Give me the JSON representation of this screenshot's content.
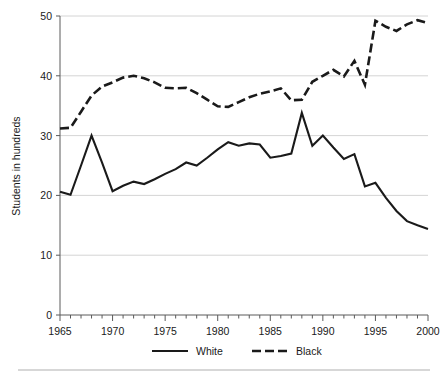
{
  "chart_data": {
    "type": "line",
    "title": "",
    "xlabel": "",
    "ylabel": "Students in hundreds",
    "xlim": [
      1965,
      2000
    ],
    "ylim": [
      0,
      50
    ],
    "yticks": [
      0,
      10,
      20,
      30,
      40,
      50
    ],
    "ytick_labels": [
      "0",
      "10",
      "20",
      "30",
      "40",
      "50"
    ],
    "xticks": [
      1965,
      1970,
      1975,
      1980,
      1985,
      1990,
      1995,
      2000
    ],
    "xtick_labels": [
      "1965",
      "1970",
      "1975",
      "1980",
      "1985",
      "1990",
      "1995",
      "2000"
    ],
    "minor_xticks_every": 1,
    "grid": "horizontal",
    "legend_position": "bottom",
    "x": [
      1965,
      1966,
      1967,
      1968,
      1969,
      1970,
      1971,
      1972,
      1973,
      1974,
      1975,
      1976,
      1977,
      1978,
      1979,
      1980,
      1981,
      1982,
      1983,
      1984,
      1985,
      1986,
      1987,
      1988,
      1989,
      1990,
      1991,
      1992,
      1993,
      1994,
      1995,
      1996,
      1997,
      1998,
      1999,
      2000
    ],
    "series": [
      {
        "name": "White",
        "style": "solid",
        "color": "#1a1a1a",
        "values": [
          20.6,
          20.1,
          25.0,
          30.0,
          25.5,
          20.7,
          21.6,
          22.3,
          21.9,
          22.7,
          23.6,
          24.4,
          25.5,
          25.0,
          26.3,
          27.7,
          28.9,
          28.3,
          28.7,
          28.5,
          26.3,
          26.6,
          27.0,
          33.8,
          28.3,
          30.0,
          28.0,
          26.1,
          26.9,
          21.5,
          22.1,
          19.6,
          17.4,
          15.7,
          15.0,
          14.4
        ]
      },
      {
        "name": "Black",
        "style": "dashed",
        "color": "#1a1a1a",
        "values": [
          31.2,
          31.3,
          34.0,
          36.7,
          38.2,
          38.9,
          39.7,
          40.0,
          39.6,
          38.9,
          38.0,
          37.9,
          38.0,
          37.1,
          36.0,
          34.9,
          34.8,
          35.6,
          36.4,
          37.0,
          37.4,
          37.9,
          35.9,
          36.0,
          39.0,
          40.0,
          41.0,
          39.9,
          42.5,
          38.5,
          49.2,
          48.2,
          47.5,
          48.6,
          49.3,
          48.8
        ]
      }
    ],
    "legend": [
      {
        "label": "White",
        "style": "solid"
      },
      {
        "label": "Black",
        "style": "dashed"
      }
    ]
  }
}
